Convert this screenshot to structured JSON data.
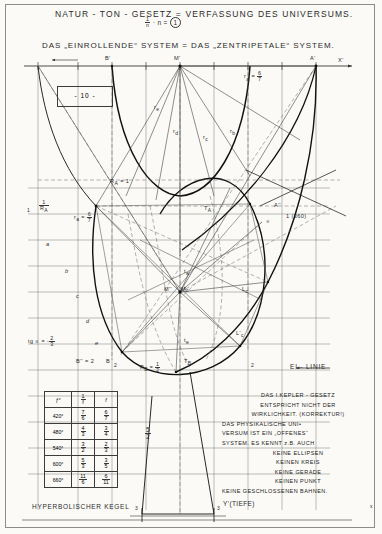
{
  "page": {
    "number_label": "- 10 -"
  },
  "header": {
    "title": "NATUR - TON - GESETZ  =  VERFASSUNG   DES  UNIVERSUMS.",
    "formula": {
      "fraction_numerator": "1",
      "fraction_denominator": "n",
      "rest": "· n =",
      "circled": "1"
    },
    "subtitle": "DAS „EINROLLENDE“ SYSTEM = DAS „ZENTRIPETALE“ SYSTEM."
  },
  "axes": {
    "x_axis_label": "X'",
    "y_axis_label": "Y'(TIEFE)",
    "point_B_top": "B'",
    "point_M_top": "M'",
    "point_A_top": "A'",
    "bottom_left_tick": "3",
    "bottom_right_tick": "3"
  },
  "labels": {
    "r_a_top": {
      "name": "r",
      "sub": "a",
      "eq": "=",
      "num": "6",
      "den": "7"
    },
    "r_e": "r",
    "r_e_sub": "e",
    "r_d": "r",
    "r_d_sub": "d",
    "r_c": "r",
    "r_c_sub": "c",
    "r_b": "r",
    "r_b_sub": "b",
    "R_A": "R",
    "R_A_sub": "A",
    "R_A_val": "= 1",
    "one": "1",
    "inv_RA_num": "1",
    "inv_RA_den": "R",
    "inv_RA_den_sub": "A",
    "r_a_left": "r",
    "r_a_left_sub": "a",
    "r_a_left_eq": "=",
    "r_a_left_num": "6",
    "r_a_left_den": "7",
    "curve_a": "a",
    "curve_b": "b",
    "curve_c": "c",
    "curve_d": "d",
    "curve_e": "e",
    "tg_alpha": "tg ∝ =",
    "tg_num": "2",
    "tg_den": "3",
    "tg_minus": "-",
    "B_dd": "B''",
    "B_eq": "= 2",
    "B_single": "B",
    "R_B": "R",
    "R_B_sub": "B",
    "R_B_eq": "=",
    "R_B_num": "1",
    "R_B_den": "2",
    "T_B": "T",
    "T_B_sub": "B",
    "T_A": "T",
    "T_A_sub": "A",
    "t_a": "t",
    "t_a_sub": "a",
    "t_c": "t",
    "t_c_sub": "c",
    "t_e": "t",
    "t_e_sub": "e",
    "M_dd": "M''",
    "M_plain": "M",
    "L_c": "L",
    "L_c_sub": "c",
    "L_c_prime": "L'",
    "L_c_prime_sub": "c",
    "A_dd": "A''",
    "one_360": "1 (360)",
    "alpha_sym": "∝",
    "two_left": "2",
    "two_right": "2",
    "ei_linie": "EI - LINIE",
    "five_halves_num": "5",
    "five_halves_den": "2",
    "hyperbolic": "HYPERBOLISCHER KEGEL",
    "x_small": "x"
  },
  "table": {
    "headers": [
      "ƒ°",
      "1/f",
      "f"
    ],
    "header_frac": {
      "num": "1",
      "den": "f"
    },
    "rows": [
      {
        "deg": "420°",
        "a_num": "7",
        "a_den": "6",
        "b_num": "6",
        "b_den": "7"
      },
      {
        "deg": "480°",
        "a_num": "4",
        "a_den": "3",
        "b_num": "3",
        "b_den": "4"
      },
      {
        "deg": "540°",
        "a_num": "3",
        "a_den": "2",
        "b_num": "2",
        "b_den": "3"
      },
      {
        "deg": "600°",
        "a_num": "5",
        "a_den": "3",
        "b_num": "3",
        "b_den": "5"
      },
      {
        "deg": "660°",
        "a_num": "11",
        "a_den": "6",
        "b_num": "6",
        "b_den": "11"
      }
    ]
  },
  "note": {
    "lines": [
      "DAS I.KEPLER - GESETZ",
      "ENTSPRICHT  NICHT  DER",
      "WIRKLICHKEIT. (KORREKTUR!)",
      "DAS  PHYSIKALISCHE   UNI•",
      "VERSUM  IST  EIN „OFFENES“",
      "SYSTEM. ES KENNT z.B. AUCH",
      "KEINE  ELLIPSEN",
      "KEINEN  KREIS",
      "KEINE  GERADE",
      "KEINEN  PUNKT",
      "KEINE  GESCHLOSSENEN  BAHNEN."
    ],
    "centered_from": 6
  },
  "colors": {
    "ink": "#2b2b2b",
    "paper": "#fbfaf7",
    "faint": "#9b9b9b"
  }
}
